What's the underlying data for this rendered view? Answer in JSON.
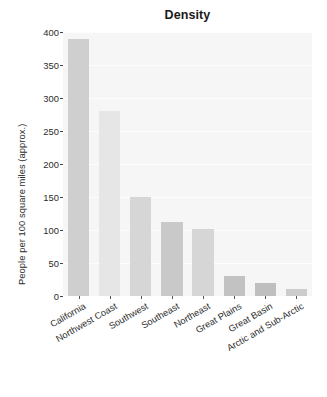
{
  "chart_data": {
    "type": "bar",
    "title": "Density",
    "xlabel": "",
    "ylabel": "People per 100 square miles (approx.)",
    "categories": [
      "California",
      "Northwest Coast",
      "Southwest",
      "Southeast",
      "Northeast",
      "Great Plains",
      "Great Basin",
      "Arctic and Sub-Arctic"
    ],
    "values": [
      390,
      280,
      150,
      112,
      101,
      30,
      20,
      10
    ],
    "bar_colors": [
      "#cfcfcf",
      "#e6e6e6",
      "#d6d6d6",
      "#c9c9c9",
      "#d6d6d6",
      "#c2c2c2",
      "#bfbfbf",
      "#cccccc"
    ],
    "ylim": [
      0,
      400
    ],
    "yticks": [
      0,
      50,
      100,
      150,
      200,
      250,
      300,
      350,
      400
    ],
    "ytick_labels": [
      "0",
      "50",
      "100",
      "150",
      "200",
      "250",
      "300",
      "350",
      "400"
    ],
    "grid": true,
    "legend": null,
    "plot_background": "#f6f6f6",
    "figure_background": "#ffffff",
    "xtick_rotation": -30
  }
}
